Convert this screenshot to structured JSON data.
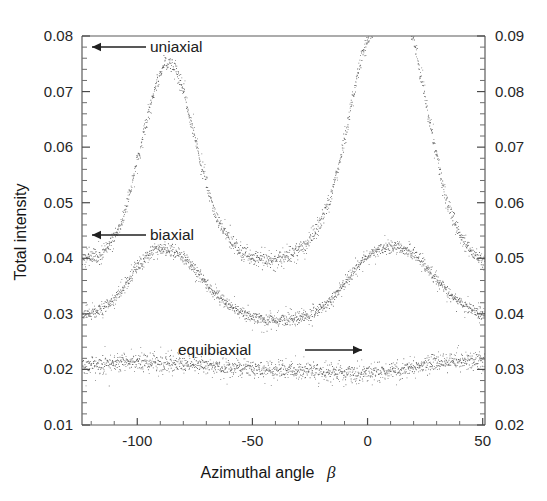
{
  "chart_data": {
    "type": "scatter",
    "title": "",
    "xlabel": "Azimuthal angle",
    "xlabel_symbol": "β",
    "ylabel": "Total intensity",
    "ylabel_right": "",
    "xlim": [
      -124,
      51
    ],
    "ylim": [
      0.01,
      0.08
    ],
    "ylim_right": [
      0.02,
      0.09
    ],
    "xticks": [
      -100,
      -50,
      0,
      50
    ],
    "xtick_labels": [
      "-100",
      "-50",
      "0",
      "50"
    ],
    "xtick_minor_step": 10,
    "yticks": [
      0.01,
      0.02,
      0.03,
      0.04,
      0.05,
      0.06,
      0.07,
      0.08
    ],
    "ytick_labels": [
      "0.01",
      "0.02",
      "0.03",
      "0.04",
      "0.05",
      "0.06",
      "0.07",
      "0.08"
    ],
    "ytick_minor_step": 0.002,
    "yticks_right": [
      0.02,
      0.03,
      0.04,
      0.05,
      0.06,
      0.07,
      0.08,
      0.09
    ],
    "ytick_labels_right": [
      "0.02",
      "0.03",
      "0.04",
      "0.05",
      "0.06",
      "0.07",
      "0.08",
      "0.09"
    ],
    "grid": false,
    "legend": "annotations",
    "marker_color": "#3a3a3a",
    "series": [
      {
        "name": "uniaxial",
        "label": "uniaxial",
        "annotation_arrow": "left",
        "noise": 0.0011,
        "baseline": 0.0385,
        "peaks": [
          {
            "center": -87,
            "amplitude": 0.0375,
            "width": 17
          },
          {
            "center": 15,
            "amplitude": 0.0445,
            "width": 16
          }
        ],
        "x": [
          -124,
          -120,
          -116,
          -112,
          -108,
          -104,
          -100,
          -96,
          -92,
          -88,
          -84,
          -80,
          -76,
          -72,
          -68,
          -64,
          -60,
          -56,
          -52,
          -48,
          -44,
          -40,
          -36,
          -32,
          -28,
          -24,
          -20,
          -16,
          -12,
          -8,
          -4,
          0,
          4,
          8,
          12,
          16,
          20,
          24,
          28,
          32,
          36,
          40,
          44,
          48,
          51
        ],
        "y": [
          0.0405,
          0.0402,
          0.0408,
          0.0425,
          0.0455,
          0.051,
          0.058,
          0.065,
          0.0715,
          0.0752,
          0.0748,
          0.07,
          0.0632,
          0.056,
          0.05,
          0.046,
          0.0432,
          0.0414,
          0.0404,
          0.04,
          0.0399,
          0.04,
          0.0404,
          0.041,
          0.0422,
          0.044,
          0.047,
          0.0515,
          0.058,
          0.066,
          0.0742,
          0.0796,
          0.082,
          0.0832,
          0.0834,
          0.0828,
          0.079,
          0.071,
          0.062,
          0.054,
          0.048,
          0.0442,
          0.0418,
          0.0402,
          0.0398
        ]
      },
      {
        "name": "biaxial",
        "label": "biaxial",
        "annotation_arrow": "left",
        "noise": 0.0009,
        "baseline": 0.0295,
        "peaks": [
          {
            "center": -87,
            "amplitude": 0.0122,
            "width": 23
          },
          {
            "center": 15,
            "amplitude": 0.0128,
            "width": 23
          }
        ],
        "x": [
          -124,
          -120,
          -116,
          -112,
          -108,
          -104,
          -100,
          -96,
          -92,
          -88,
          -84,
          -80,
          -76,
          -72,
          -68,
          -64,
          -60,
          -56,
          -52,
          -48,
          -44,
          -40,
          -36,
          -32,
          -28,
          -24,
          -20,
          -16,
          -12,
          -8,
          -4,
          0,
          4,
          8,
          12,
          16,
          20,
          24,
          28,
          32,
          36,
          40,
          44,
          48,
          51
        ],
        "y": [
          0.03,
          0.0302,
          0.0308,
          0.032,
          0.0338,
          0.0362,
          0.0388,
          0.0405,
          0.0415,
          0.0418,
          0.0414,
          0.0402,
          0.0385,
          0.0363,
          0.0343,
          0.0327,
          0.0315,
          0.0305,
          0.0298,
          0.0293,
          0.029,
          0.0289,
          0.029,
          0.0292,
          0.0296,
          0.0302,
          0.0312,
          0.0327,
          0.0346,
          0.0368,
          0.039,
          0.0406,
          0.0416,
          0.0421,
          0.0422,
          0.0418,
          0.0408,
          0.0392,
          0.0372,
          0.0352,
          0.0334,
          0.032,
          0.031,
          0.0302,
          0.0298
        ]
      },
      {
        "name": "equibiaxial",
        "label": "equibiaxial",
        "annotation_arrow": "right",
        "noise": 0.0012,
        "baseline": 0.0205,
        "peaks": [],
        "x": [
          -124,
          -120,
          -116,
          -112,
          -108,
          -104,
          -100,
          -96,
          -92,
          -88,
          -84,
          -80,
          -76,
          -72,
          -68,
          -64,
          -60,
          -56,
          -52,
          -48,
          -44,
          -40,
          -36,
          -32,
          -28,
          -24,
          -20,
          -16,
          -12,
          -8,
          -4,
          0,
          4,
          8,
          12,
          16,
          20,
          24,
          28,
          32,
          36,
          40,
          44,
          48,
          51
        ],
        "y": [
          0.0205,
          0.0207,
          0.0209,
          0.0211,
          0.0212,
          0.0213,
          0.0213,
          0.0212,
          0.0212,
          0.0211,
          0.0211,
          0.021,
          0.0209,
          0.0208,
          0.0207,
          0.0206,
          0.0205,
          0.0204,
          0.0203,
          0.0202,
          0.0201,
          0.02,
          0.0199,
          0.0198,
          0.0197,
          0.0196,
          0.0195,
          0.0194,
          0.0194,
          0.0193,
          0.0193,
          0.0194,
          0.0195,
          0.0197,
          0.0199,
          0.0202,
          0.0205,
          0.0208,
          0.0211,
          0.0213,
          0.0215,
          0.0216,
          0.0217,
          0.0218,
          0.0218
        ]
      }
    ],
    "annotations": [
      {
        "name": "uniaxial",
        "text": "uniaxial",
        "direction": "left",
        "text_x": 150,
        "text_y": 52,
        "arrow_from_x": 146,
        "arrow_from_y": 47,
        "arrow_to_x": 92,
        "arrow_to_y": 47
      },
      {
        "name": "biaxial",
        "text": "biaxial",
        "direction": "left",
        "text_x": 150,
        "text_y": 240,
        "arrow_from_x": 146,
        "arrow_from_y": 235,
        "arrow_to_x": 92,
        "arrow_to_y": 235
      },
      {
        "name": "equibiaxial",
        "text": "equibiaxial",
        "direction": "right",
        "text_x": 178,
        "text_y": 355,
        "arrow_from_x": 305,
        "arrow_from_y": 350,
        "arrow_to_x": 362,
        "arrow_to_y": 350
      }
    ]
  }
}
